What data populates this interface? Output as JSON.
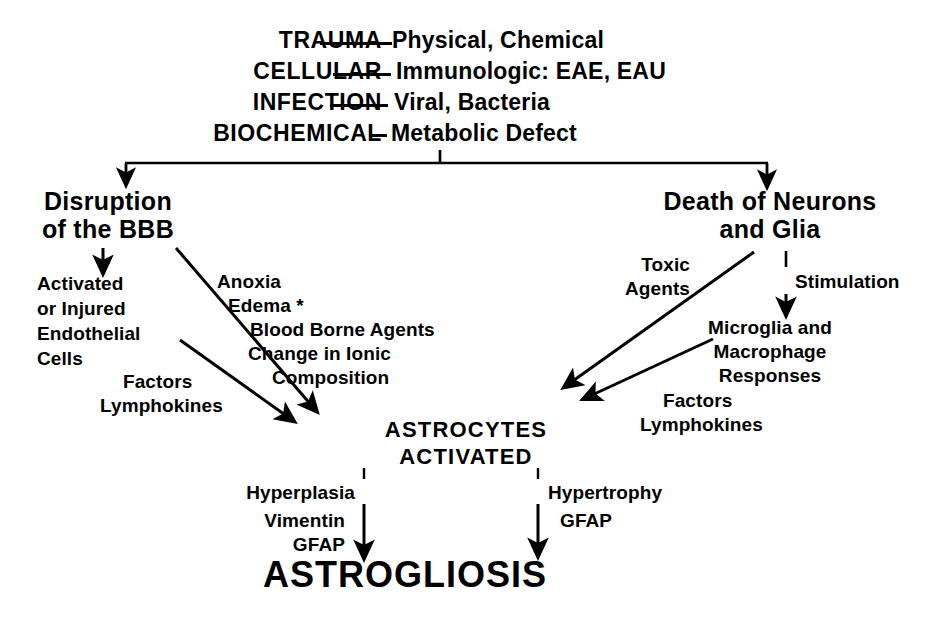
{
  "diagram": {
    "causes": [
      {
        "category": "TRAUMA",
        "detail": "Physical, Chemical"
      },
      {
        "category": "CELLULAR",
        "detail": "Immunologic: EAE, EAU"
      },
      {
        "category": "INFECTION",
        "detail": "Viral, Bacteria"
      },
      {
        "category": "BIOCHEMICAL",
        "detail": "Metabolic Defect"
      }
    ],
    "left_branch": {
      "node": "Disruption\nof the BBB",
      "line1": "Disruption",
      "line2": "of the BBB",
      "sub_node": "Activated\nor Injured\nEndothelial\nCells",
      "sub_line1": "Activated",
      "sub_line2": "or Injured",
      "sub_line3": "Endothelial",
      "sub_line4": "Cells",
      "mediators_label_1": "Factors",
      "mediators_label_2": "Lymphokines",
      "mechanisms": [
        "Anoxia",
        "Edema *",
        "Blood Borne Agents",
        "Change in Ionic",
        "Composition"
      ]
    },
    "right_branch": {
      "node": "Death of Neurons\nand Glia",
      "line1": "Death of Neurons",
      "line2": "and Glia",
      "toxic_label_1": "Toxic",
      "toxic_label_2": "Agents",
      "stimulation_label": "Stimulation",
      "sub_node_1": "Microglia and",
      "sub_node_2": "Macrophage",
      "sub_node_3": "Responses",
      "mediators_label_1": "Factors",
      "mediators_label_2": "Lymphokines"
    },
    "center": {
      "line1": "ASTROCYTES",
      "line2": "ACTIVATED"
    },
    "outcomes": {
      "left_label": "Hyperplasia",
      "left_markers_1": "Vimentin",
      "left_markers_2": "GFAP",
      "right_label": "Hypertrophy",
      "right_markers_1": "GFAP"
    },
    "final": "ASTROGLIOSIS",
    "colors": {
      "ink": "#000000",
      "background": "#ffffff"
    }
  }
}
